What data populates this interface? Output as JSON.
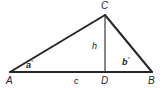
{
  "figure": {
    "kind": "geometry-diagram",
    "shape": "triangle-with-altitude",
    "background_color": "#ffffff",
    "stroke_color": "#26262a",
    "text_color": "#26262a"
  },
  "vertices": [
    {
      "key": "A",
      "label": "A",
      "x": 10,
      "y": 72
    },
    {
      "key": "B",
      "label": "B",
      "x": 152,
      "y": 72
    },
    {
      "key": "C",
      "label": "C",
      "x": 105,
      "y": 15
    },
    {
      "key": "D",
      "label": "D",
      "x": 105,
      "y": 72
    }
  ],
  "sides": [
    {
      "key": "AC",
      "from": "A",
      "to": "C",
      "width": 2
    },
    {
      "key": "CB",
      "from": "C",
      "to": "B",
      "width": 2
    },
    {
      "key": "AB",
      "from": "A",
      "to": "B",
      "width": 2
    }
  ],
  "altitude": {
    "key": "CD",
    "from": "C",
    "to": "D",
    "width": 1,
    "label": "h"
  },
  "segment_labels": [
    {
      "key": "c",
      "label": "c",
      "describes": "AD"
    },
    {
      "key": "h",
      "label": "h",
      "describes": "CD"
    }
  ],
  "angles": [
    {
      "key": "a",
      "at": "A",
      "label": "a",
      "degree_symbol": "°"
    },
    {
      "key": "b",
      "at": "B",
      "label": "b",
      "degree_symbol": "°"
    }
  ],
  "labels": {
    "vertex_a": "A",
    "vertex_b": "B",
    "vertex_c": "C",
    "vertex_d": "D",
    "base_segment": "c",
    "height_segment": "h",
    "angle_a": "a",
    "angle_b": "b",
    "degree": "°"
  }
}
